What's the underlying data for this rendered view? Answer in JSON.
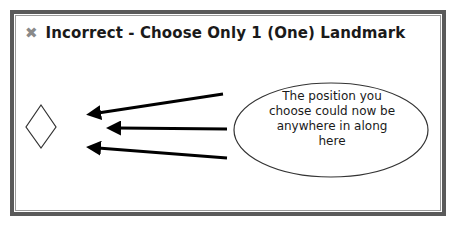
{
  "dialog": {
    "close_icon": "close-x-icon",
    "title": "Incorrect - Choose Only 1 (One) Landmark"
  },
  "diagram": {
    "landmark_shape": "diamond",
    "arrow_count": 3,
    "callout": {
      "lines": [
        "The position you",
        "choose could now be",
        "anywhere in along",
        "here"
      ]
    }
  },
  "colors": {
    "frame": "#5a5a5a",
    "close_icon": "#8a8a8a",
    "text": "#1a1a1a"
  }
}
